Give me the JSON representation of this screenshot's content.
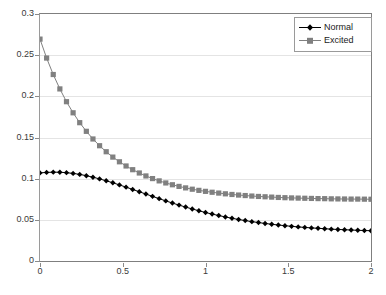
{
  "chart_data": {
    "type": "line",
    "title": "",
    "xlabel": "",
    "ylabel": "",
    "xlim": [
      0,
      2
    ],
    "ylim": [
      0,
      0.3
    ],
    "grid": true,
    "legend_position": "top-right",
    "x_ticks": [
      "0",
      "0.5",
      "1",
      "1.5",
      "2"
    ],
    "x_tick_values": [
      0,
      0.5,
      1,
      1.5,
      2
    ],
    "y_ticks": [
      "0",
      "0.05",
      "0.1",
      "0.15",
      "0.2",
      "0.25",
      "0.3"
    ],
    "y_tick_values": [
      0,
      0.05,
      0.1,
      0.15,
      0.2,
      0.25,
      0.3
    ],
    "x": [
      0,
      0.04,
      0.08,
      0.12,
      0.16,
      0.2,
      0.24,
      0.28,
      0.32,
      0.36,
      0.4,
      0.44,
      0.48,
      0.52,
      0.56,
      0.6,
      0.64,
      0.68,
      0.72,
      0.76,
      0.8,
      0.84,
      0.88,
      0.92,
      0.96,
      1.0,
      1.04,
      1.08,
      1.12,
      1.16,
      1.2,
      1.24,
      1.28,
      1.32,
      1.36,
      1.4,
      1.44,
      1.48,
      1.52,
      1.56,
      1.6,
      1.64,
      1.68,
      1.72,
      1.76,
      1.8,
      1.84,
      1.88,
      1.92,
      1.96,
      2.0
    ],
    "series": [
      {
        "name": "Normal",
        "color": "#000000",
        "marker": "diamond",
        "values": [
          0.107,
          0.1076,
          0.1079,
          0.1078,
          0.1073,
          0.1064,
          0.1052,
          0.1036,
          0.1018,
          0.0997,
          0.0974,
          0.095,
          0.0924,
          0.0897,
          0.0869,
          0.0841,
          0.0813,
          0.0785,
          0.0757,
          0.073,
          0.0704,
          0.0679,
          0.0655,
          0.0632,
          0.061,
          0.0589,
          0.057,
          0.0552,
          0.0535,
          0.0519,
          0.0504,
          0.0491,
          0.0478,
          0.0467,
          0.0456,
          0.0446,
          0.0437,
          0.0429,
          0.0421,
          0.0414,
          0.0408,
          0.0402,
          0.0397,
          0.0392,
          0.0387,
          0.0383,
          0.038,
          0.0376,
          0.0373,
          0.037,
          0.0368
        ]
      },
      {
        "name": "Excited",
        "color": "#808080",
        "marker": "square",
        "values": [
          0.2695,
          0.2465,
          0.2265,
          0.209,
          0.1935,
          0.18,
          0.168,
          0.1575,
          0.1482,
          0.14,
          0.1327,
          0.1262,
          0.1205,
          0.1154,
          0.1109,
          0.1069,
          0.1033,
          0.1001,
          0.0973,
          0.0948,
          0.0926,
          0.0906,
          0.0888,
          0.0872,
          0.0858,
          0.0846,
          0.0835,
          0.0825,
          0.0816,
          0.0808,
          0.0801,
          0.0795,
          0.0789,
          0.0784,
          0.078,
          0.0776,
          0.0772,
          0.0769,
          0.0766,
          0.0764,
          0.0762,
          0.076,
          0.0758,
          0.0757,
          0.0755,
          0.0754,
          0.0753,
          0.0752,
          0.0752,
          0.0751,
          0.075
        ]
      }
    ]
  },
  "legend": {
    "items": [
      {
        "label": "Normal"
      },
      {
        "label": "Excited"
      }
    ]
  },
  "colors": {
    "normal": "#000000",
    "excited": "#808080",
    "grid": "#e4e4e4",
    "axis": "#7f7f7f",
    "background": "#ffffff"
  }
}
